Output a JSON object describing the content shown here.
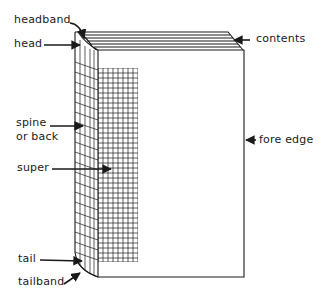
{
  "diagram": {
    "colors": {
      "ink": "#1a1a1a",
      "background": "#ffffff"
    },
    "labels": {
      "headband": "headband",
      "head": "head",
      "contents": "contents",
      "spine_line1": "spine",
      "spine_line2": "or back",
      "super": "super",
      "fore_edge": "fore edge",
      "tail": "tail",
      "tailband": "tailband"
    }
  }
}
